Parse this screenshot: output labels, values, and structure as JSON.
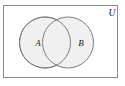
{
  "figure": {
    "kind": "venn-diagram",
    "canvas": {
      "width": 125,
      "height": 86,
      "background": "#ffffff"
    }
  },
  "universe": {
    "label": "U",
    "label_x": 112,
    "label_y": 16,
    "rect": {
      "x": 3.5,
      "y": 5.5,
      "width": 114,
      "height": 72
    },
    "stroke": "#8a8a8a",
    "stroke_width": 1,
    "fill": "#ffffff"
  },
  "sets": [
    {
      "name": "set-a",
      "label": "A",
      "cx": 45,
      "cy": 42.5,
      "r": 25.5,
      "label_x": 38,
      "label_y": 46,
      "fill": "#f0f0f0",
      "stroke": "#7d7d7d",
      "stroke_width": 1
    },
    {
      "name": "set-b",
      "label": "B",
      "cx": 68,
      "cy": 42.5,
      "r": 25.5,
      "label_x": 81,
      "label_y": 46,
      "fill": "#f0f0f0",
      "stroke": "#7d7d7d",
      "stroke_width": 1
    }
  ],
  "intersection": {
    "name": "a-intersect-b",
    "fill": "#f0f0f0",
    "shaded": false
  },
  "colors": {
    "circle_fill": "#f0f0f0",
    "circle_stroke": "#7d7d7d",
    "rect_stroke": "#8a8a8a",
    "text": "#1a1a1a",
    "background": "#ffffff"
  }
}
